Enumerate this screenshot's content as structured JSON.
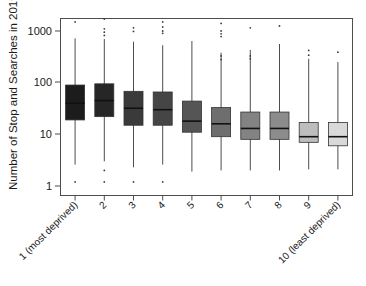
{
  "chart_data": {
    "type": "box",
    "title": "",
    "xlabel": "",
    "ylabel": "Number of Stop and Searches in 2019",
    "yscale": "log",
    "ylim": [
      1,
      2500
    ],
    "yticks": [
      1,
      10,
      100,
      1000
    ],
    "ytick_labels": [
      "1",
      "10",
      "100",
      "1000"
    ],
    "grid": false,
    "legend": "none",
    "categories": [
      "1 (most deprived)",
      "2",
      "3",
      "4",
      "5",
      "6",
      "7",
      "8",
      "9",
      "10 (least deprived)"
    ],
    "box_colors": [
      "#1c1c1c",
      "#262626",
      "#3a3a3a",
      "#454545",
      "#555555",
      "#6e6e6e",
      "#838383",
      "#8c8c8c",
      "#bdbdbd",
      "#d9d9d9"
    ],
    "boxes": [
      {
        "category": "1 (most deprived)",
        "whisker_low": 2.6,
        "q1": 19,
        "median": 40,
        "q3": 90,
        "whisker_high": 720,
        "outliers": [
          1500,
          1.2
        ]
      },
      {
        "category": "2",
        "whisker_low": 3.0,
        "q1": 22,
        "median": 45,
        "q3": 95,
        "whisker_high": 700,
        "outliers": [
          1700,
          1100,
          950,
          820,
          2.0,
          1.2
        ]
      },
      {
        "category": "3",
        "whisker_low": 2.3,
        "q1": 15,
        "median": 32,
        "q3": 68,
        "whisker_high": 620,
        "outliers": [
          1800,
          1150,
          980,
          1.2
        ]
      },
      {
        "category": "4",
        "whisker_low": 2.6,
        "q1": 15,
        "median": 30,
        "q3": 66,
        "whisker_high": 530,
        "outliers": [
          2050,
          1500,
          1200,
          1000,
          900,
          1.2
        ]
      },
      {
        "category": "5",
        "whisker_low": 1.9,
        "q1": 11,
        "median": 18,
        "q3": 44,
        "whisker_high": 640,
        "outliers": []
      },
      {
        "category": "6",
        "whisker_low": 2.0,
        "q1": 9,
        "median": 16,
        "q3": 33,
        "whisker_high": 380,
        "outliers": [
          1400,
          1000,
          880,
          780,
          330,
          280
        ]
      },
      {
        "category": "7",
        "whisker_low": 2.0,
        "q1": 8,
        "median": 13,
        "q3": 27,
        "whisker_high": 430,
        "outliers": [
          1150,
          330,
          290
        ]
      },
      {
        "category": "8",
        "whisker_low": 2.0,
        "q1": 8,
        "median": 13,
        "q3": 27,
        "whisker_high": 560,
        "outliers": [
          1900,
          1250
        ]
      },
      {
        "category": "9",
        "whisker_low": 2.1,
        "q1": 7,
        "median": 9,
        "q3": 17,
        "whisker_high": 290,
        "outliers": [
          420,
          340
        ]
      },
      {
        "category": "10 (least deprived)",
        "whisker_low": 2.1,
        "q1": 6,
        "median": 9,
        "q3": 17,
        "whisker_high": 250,
        "outliers": [
          390
        ]
      }
    ]
  },
  "axis": {
    "y_title": "Number of Stop and Searches in 2019",
    "y_labels": [
      "1000",
      "100",
      "10",
      "1"
    ],
    "x_labels": [
      "1 (most deprived)",
      "2",
      "3",
      "4",
      "5",
      "6",
      "7",
      "8",
      "9",
      "10 (least deprived)"
    ]
  }
}
